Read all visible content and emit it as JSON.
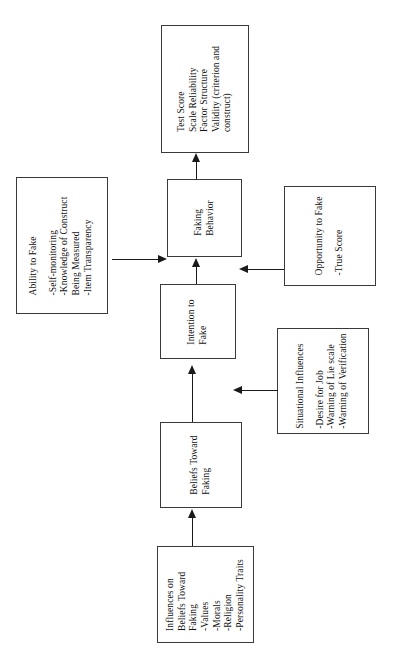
{
  "diagram": {
    "orientation": "rotated-90-ccw",
    "text_color": "#111111",
    "line_color": "#1a1a1a",
    "box_border_color": "#3a3a3a",
    "background": "#ffffff"
  },
  "nodes": {
    "test_score": {
      "id": "test-score",
      "heading": "Test Score",
      "lines": [
        "Scale Reliability",
        "Factor Structure",
        "Validity (criterion and",
        "construct)"
      ]
    },
    "faking_behavior": {
      "id": "faking-behavior",
      "lines": [
        "Faking",
        "Behavior"
      ]
    },
    "ability_to_fake": {
      "id": "ability-to-fake",
      "heading": "Ability to Fake",
      "lines": [
        "-Self-monitoring",
        "-Knowledge of Construct",
        "Being Measured",
        "-Item Transparency"
      ]
    },
    "opportunity_to_fake": {
      "id": "opportunity-to-fake",
      "heading": "Opportunity to Fake",
      "lines": [
        "-True Score"
      ]
    },
    "intention_to_fake": {
      "id": "intention-to-fake",
      "lines": [
        "Intention to",
        "Fake"
      ]
    },
    "situational_influences": {
      "id": "situational-influences",
      "heading": "Situational Influences",
      "lines": [
        "-Desire for Job",
        "-Warning of Lie scale",
        "-Warning of Verification"
      ]
    },
    "beliefs_toward_faking": {
      "id": "beliefs-toward-faking",
      "lines": [
        "Beliefs Toward",
        "Faking"
      ]
    },
    "influences_on_beliefs": {
      "id": "influences-on-beliefs",
      "heading_lines": [
        "Influences on",
        "Beliefs Toward",
        "Faking"
      ],
      "lines": [
        "-Values",
        "-Morals",
        "-Religion",
        "-Personality Traits"
      ]
    }
  },
  "edges": [
    {
      "id": "edge-faking-to-testscore",
      "from": "faking_behavior",
      "to": "test_score",
      "direction": "up"
    },
    {
      "id": "edge-ability-to-faking",
      "from": "ability_to_fake",
      "to": "faking_behavior",
      "direction": "right"
    },
    {
      "id": "edge-opportunity-to-faking",
      "from": "opportunity_to_fake",
      "to": "faking_behavior",
      "direction": "left"
    },
    {
      "id": "edge-intention-to-faking",
      "from": "intention_to_fake",
      "to": "faking_behavior",
      "direction": "up"
    },
    {
      "id": "edge-situational-to-intention",
      "from": "situational_influences",
      "to": "intention_to_fake",
      "direction": "left"
    },
    {
      "id": "edge-beliefs-to-intention",
      "from": "beliefs_toward_faking",
      "to": "intention_to_fake",
      "direction": "up"
    },
    {
      "id": "edge-influences-to-beliefs",
      "from": "influences_on_beliefs",
      "to": "beliefs_toward_faking",
      "direction": "up"
    }
  ]
}
